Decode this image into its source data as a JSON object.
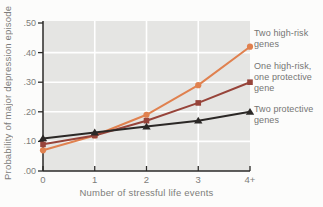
{
  "figure": {
    "background": "#fcfcfb",
    "plot_bg": "#e5e5e3",
    "grid_color": "#ffffff",
    "axis_color": "#2b2a28",
    "text_color": "#7c7c7a"
  },
  "chart_data": {
    "type": "line",
    "title": "",
    "xlabel": "Number of stressful life events",
    "ylabel": "Probability of major depression episode",
    "x_tick_labels": [
      "0",
      "1",
      "2",
      "3",
      "4+"
    ],
    "y_tick_labels": [
      ".00",
      ".10",
      ".20",
      ".30",
      ".40",
      ".50"
    ],
    "ylim": [
      0,
      0.5
    ],
    "grid": true,
    "legend_position": "right",
    "series": [
      {
        "name": "Two high-risk genes",
        "marker": "circle",
        "color": "#e0814f",
        "values": [
          0.07,
          0.12,
          0.19,
          0.29,
          0.42
        ]
      },
      {
        "name": "One high-risk, one protective gene",
        "marker": "square",
        "color": "#97443a",
        "values": [
          0.09,
          0.12,
          0.17,
          0.23,
          0.3
        ]
      },
      {
        "name": "Two protective genes",
        "marker": "triangle",
        "color": "#2b2826",
        "values": [
          0.11,
          0.13,
          0.15,
          0.17,
          0.2
        ]
      }
    ]
  }
}
